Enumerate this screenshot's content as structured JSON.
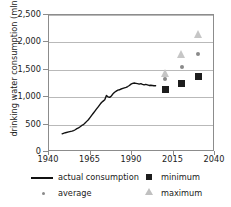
{
  "chart_data": {
    "type": "scatter",
    "title": "",
    "xlabel": "",
    "ylabel": "drinking water consumption (mln m3/y)",
    "ylabel_prefix": "drinking water consumption (mln m",
    "ylabel_exponent": "3",
    "ylabel_suffix": "/y)",
    "xlim": [
      1940,
      2040
    ],
    "ylim": [
      0,
      2500
    ],
    "grid": true,
    "legend_position": "bottom",
    "yticks": [
      0,
      500,
      1000,
      1500,
      2000,
      2500
    ],
    "ytick_labels": [
      "0",
      "500",
      "1,000",
      "1,500",
      "2,000",
      "2,500"
    ],
    "xticks": [
      1940,
      1965,
      1990,
      2015,
      2040
    ],
    "xtick_labels": [
      "1940",
      "1965",
      "1990",
      "2015",
      "2040"
    ],
    "series": [
      {
        "name": "actual consumption",
        "marker": "line",
        "color": "#111111",
        "x": [
          1948,
          1950,
          1952,
          1954,
          1955,
          1956,
          1957,
          1958,
          1959,
          1960,
          1961,
          1962,
          1963,
          1964,
          1965,
          1966,
          1967,
          1968,
          1969,
          1970,
          1971,
          1972,
          1973,
          1974,
          1975,
          1976,
          1977,
          1978,
          1979,
          1980,
          1981,
          1982,
          1983,
          1984,
          1985,
          1986,
          1987,
          1988,
          1989,
          1990,
          1991,
          1992,
          1993,
          1994,
          1995,
          1996,
          1997,
          1998,
          1999,
          2000,
          2001,
          2002,
          2003,
          2004,
          2005
        ],
        "y": [
          300,
          320,
          335,
          350,
          360,
          375,
          395,
          410,
          430,
          455,
          470,
          500,
          530,
          560,
          600,
          640,
          680,
          720,
          760,
          800,
          840,
          880,
          905,
          930,
          1010,
          985,
          975,
          1000,
          1040,
          1070,
          1090,
          1110,
          1115,
          1130,
          1140,
          1150,
          1160,
          1175,
          1195,
          1220,
          1235,
          1240,
          1235,
          1230,
          1220,
          1230,
          1215,
          1205,
          1215,
          1205,
          1195,
          1200,
          1195,
          1190,
          1190
        ]
      },
      {
        "name": "minimum",
        "marker": "square",
        "color": "#1d1d1d",
        "x": [
          2010,
          2020,
          2030
        ],
        "y": [
          1140,
          1250,
          1385
        ]
      },
      {
        "name": "average",
        "marker": "dot",
        "color": "#8a8a8a",
        "x": [
          2010,
          2020,
          2030
        ],
        "y": [
          1330,
          1545,
          1790
        ]
      },
      {
        "name": "maximum",
        "marker": "triangle",
        "color": "#c6c6c6",
        "x": [
          2010,
          2020,
          2030
        ],
        "y": [
          1440,
          1780,
          2150
        ]
      }
    ],
    "legend": [
      {
        "label": "actual consumption",
        "marker": "line",
        "color": "#111111"
      },
      {
        "label": "minimum",
        "marker": "square",
        "color": "#1d1d1d"
      },
      {
        "label": "average",
        "marker": "dot",
        "color": "#8a8a8a"
      },
      {
        "label": "maximum",
        "marker": "triangle",
        "color": "#c6c6c6"
      }
    ]
  }
}
